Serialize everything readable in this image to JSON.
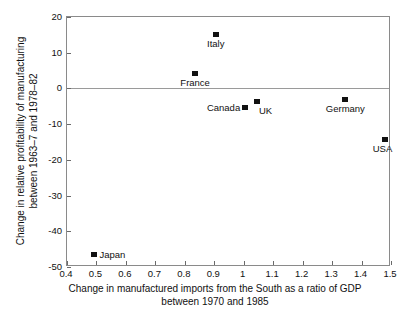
{
  "chart_data": {
    "type": "scatter",
    "title": "",
    "xlabel": "Change in manufactured imports from the South as a ratio of GDP between 1970 and 1985",
    "xlabel_lines": [
      "Change in manufactured imports from the South as a ratio of GDP",
      "between 1970 and 1985"
    ],
    "ylabel": "Change in relative profitability of manufacturing between 1963–7 and 1978–82",
    "ylabel_lines": [
      "Change in relative profitability of manufacturing",
      "between 1963–7 and 1978–82"
    ],
    "xlim": [
      0.4,
      1.5
    ],
    "ylim": [
      -50,
      20
    ],
    "xticks": [
      0.4,
      0.5,
      0.6,
      0.7,
      0.8,
      0.9,
      1.0,
      1.1,
      1.2,
      1.3,
      1.4,
      1.5
    ],
    "xticklabels": [
      "0.4",
      "0.5",
      "0.6",
      "0.7",
      "0.8",
      "0.9",
      "1",
      "1.1",
      "1.2",
      "1.3",
      "1.4",
      "1.5"
    ],
    "yticks": [
      20,
      10,
      0,
      -10,
      -20,
      -30,
      -40,
      -50
    ],
    "yticklabels": [
      "20",
      "10",
      "0",
      "-10",
      "-20",
      "-30",
      "-40",
      "-50"
    ],
    "grid": false,
    "zero_line": true,
    "legend": "none",
    "marker_color": "#111111",
    "frame_color": "#8a8a8a",
    "points": [
      {
        "label": "Japan",
        "x": 0.49,
        "y": -46.7,
        "label_pos": "right"
      },
      {
        "label": "France",
        "x": 0.835,
        "y": 4.0,
        "label_pos": "below"
      },
      {
        "label": "Italy",
        "x": 0.905,
        "y": 15.1,
        "label_pos": "below"
      },
      {
        "label": "Canada",
        "x": 1.005,
        "y": -5.5,
        "label_pos": "left"
      },
      {
        "label": "UK",
        "x": 1.045,
        "y": -3.8,
        "label_pos": "below-left"
      },
      {
        "label": "Germany",
        "x": 1.345,
        "y": -3.2,
        "label_pos": "below"
      },
      {
        "label": "USA",
        "x": 1.478,
        "y": -14.3,
        "label_pos": "below-right"
      }
    ]
  }
}
